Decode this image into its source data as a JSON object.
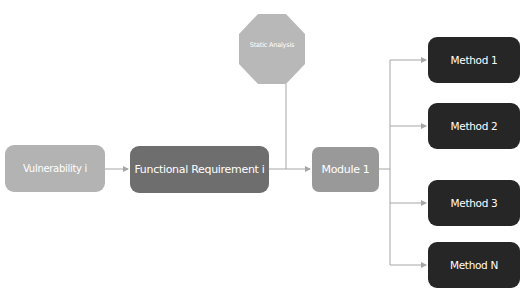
{
  "diagram": {
    "nodes": {
      "vulnerability": {
        "label": "Vulnerability i",
        "shape": "rounded-rect",
        "color": "#b3b3b3"
      },
      "functional_requirement": {
        "label": "Functional Requirement i",
        "shape": "rounded-rect",
        "color": "#6e6e6e"
      },
      "static_analysis": {
        "label": "Static Analysis",
        "shape": "octagon",
        "color": "#b8b8b8"
      },
      "module": {
        "label": "Module 1",
        "shape": "rounded-rect",
        "color": "#999999"
      },
      "methods": [
        {
          "label": "Method 1",
          "color": "#262626"
        },
        {
          "label": "Method 2",
          "color": "#262626"
        },
        {
          "label": "Method 3",
          "color": "#262626"
        },
        {
          "label": "Method N",
          "color": "#262626"
        }
      ]
    },
    "edges": [
      {
        "from": "Vulnerability i",
        "to": "Functional Requirement i"
      },
      {
        "from": "Functional Requirement i",
        "to": "Module 1"
      },
      {
        "from": "Static Analysis",
        "to": "Module 1"
      },
      {
        "from": "Module 1",
        "to": "Method 1"
      },
      {
        "from": "Module 1",
        "to": "Method 2"
      },
      {
        "from": "Module 1",
        "to": "Method 3"
      },
      {
        "from": "Module 1",
        "to": "Method N"
      }
    ],
    "line_color": "#a6a6a6"
  }
}
